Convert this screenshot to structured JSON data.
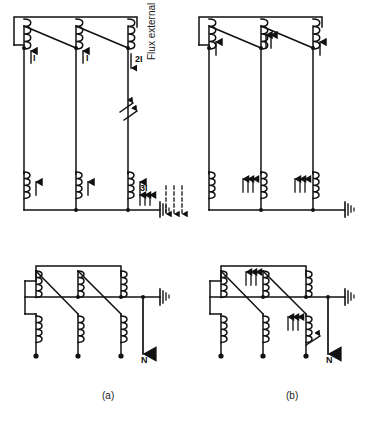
{
  "figure": {
    "panels": [
      {
        "id": "a",
        "caption": "(a)",
        "description": "Three-limb core transformer with external flux return path; zero-sequence currents",
        "top_winding_arrows": [
          "1",
          "1",
          "2-down"
        ],
        "bottom_winding_arrows": [
          "1",
          "1",
          "1"
        ],
        "labels": [
          "I",
          "I",
          "2I",
          "3I"
        ],
        "has_fault_symbol": true,
        "has_ground": true,
        "neutral_label": "N"
      },
      {
        "id": "b",
        "caption": "(b)",
        "description": "Five-limb core transformer, flux contained in core; zero-sequence currents",
        "top_winding_arrows": [
          "1",
          "2",
          "1"
        ],
        "bottom_winding_arrows": [
          "3",
          "3",
          "3"
        ],
        "labels": [],
        "has_fault_symbol": true,
        "has_ground": true,
        "neutral_label": "N"
      }
    ],
    "annotations": {
      "flux_note": "Flux external to core",
      "current_label_single": "I",
      "current_label_double": "2I",
      "current_label_triple": "3I",
      "neutral": "N",
      "caption_a": "(a)",
      "caption_b": "(b)"
    },
    "colors": {
      "line": "#111111",
      "background": "#ffffff",
      "text": "#1a1a1a"
    }
  }
}
